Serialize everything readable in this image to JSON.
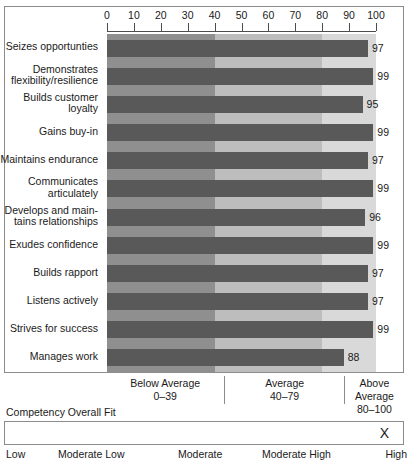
{
  "chart_data": {
    "type": "bar",
    "orientation": "horizontal",
    "title": "",
    "xlabel": "",
    "ylabel": "",
    "xlim": [
      0,
      100
    ],
    "grid": false,
    "legend_position": "below-axis",
    "tick_labels": [
      "0",
      "10",
      "20",
      "30",
      "40",
      "50",
      "60",
      "70",
      "80",
      "90",
      "100"
    ],
    "tick_values": [
      0,
      10,
      20,
      30,
      40,
      50,
      60,
      70,
      80,
      90,
      100
    ],
    "categories": [
      "Seizes opportunties",
      "Demonstrates flexibility/resilience",
      "Builds customer loyalty",
      "Gains buy-in",
      "Maintains endurance",
      "Communicates articulately",
      "Develops and main- tains relationships",
      "Exudes confidence",
      "Builds rapport",
      "Listens actively",
      "Strives for success",
      "Manages work"
    ],
    "category_lines": [
      [
        "Seizes opportunties"
      ],
      [
        "Demonstrates",
        "flexibility/resilience"
      ],
      [
        "Builds customer",
        "loyalty"
      ],
      [
        "Gains buy-in"
      ],
      [
        "Maintains endurance"
      ],
      [
        "Communicates",
        "articulately"
      ],
      [
        "Develops and main-",
        "tains relationships"
      ],
      [
        "Exudes confidence"
      ],
      [
        "Builds rapport"
      ],
      [
        "Listens actively"
      ],
      [
        "Strives for success"
      ],
      [
        "Manages work"
      ]
    ],
    "values": [
      97,
      99,
      95,
      99,
      97,
      99,
      96,
      99,
      97,
      97,
      99,
      88
    ],
    "bands": [
      {
        "label": "Below Average",
        "range_label": "0–39",
        "min": 0,
        "max": 39,
        "color": "#8f8f8f"
      },
      {
        "label": "Average",
        "range_label": "40–79",
        "min": 40,
        "max": 79,
        "color": "#bdbdbd"
      },
      {
        "label": "Above Average",
        "range_label": "80–100",
        "min": 80,
        "max": 100,
        "color": "#d9d9d9"
      }
    ],
    "bar_color": "#595959"
  },
  "overall_fit": {
    "title": "Competency Overall Fit",
    "marker": "X",
    "marker_position_label": "High",
    "scale_labels": [
      "Low",
      "Moderate Low",
      "Moderate",
      "Moderate High",
      "High"
    ]
  }
}
